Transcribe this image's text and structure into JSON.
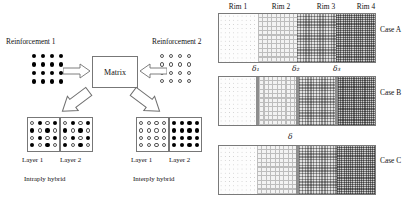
{
  "left_panel": {
    "reinforcement_1": {
      "label": "Reinforcement 1",
      "marker": "filled-dot",
      "rows": 4,
      "cols": 4
    },
    "reinforcement_2": {
      "label": "Reinforcement 2",
      "marker": "hollow-circle",
      "rows": 4,
      "cols": 4
    },
    "matrix": {
      "label": "Matrix"
    },
    "intraply": {
      "caption": "Intraply hybrid",
      "layer1_label": "Layer 1",
      "layer2_label": "Layer 2",
      "layer1_pattern": "checkerboard-mixed",
      "layer2_pattern": "checkerboard-mixed"
    },
    "interply": {
      "caption": "Interply hybrid",
      "layer1_label": "Layer 1",
      "layer2_label": "Layer 2",
      "layer1_pattern": "all-hollow",
      "layer2_pattern": "all-filled"
    },
    "arrows": {
      "reinf1_to_matrix": "block-arrow-right",
      "reinf2_to_matrix": "block-arrow-left",
      "matrix_to_intraply": "block-arrow-down-left",
      "matrix_to_interply": "block-arrow-down-right"
    }
  },
  "right_panel": {
    "rim_headers": [
      "Rim 1",
      "Rim 2",
      "Rim 3",
      "Rim 4"
    ],
    "rim_patterns": [
      "sparse-dots",
      "grid-crosshatch",
      "medium-checker",
      "dense-checker"
    ],
    "cases": [
      {
        "label": "Case A",
        "interface_labels": [],
        "interface_widths": [
          0,
          0,
          0
        ],
        "description": "no interphase layers"
      },
      {
        "label": "Case B",
        "interface_labels": [
          "δ₁",
          "δ₂",
          "δ₃"
        ],
        "interface_widths": [
          3,
          3,
          3
        ],
        "description": "three distinct interphase layers"
      },
      {
        "label": "Case C",
        "interface_labels": [
          "δ"
        ],
        "interface_widths": [
          0,
          3,
          0
        ],
        "description": "single interphase layer at center"
      }
    ]
  },
  "colors": {
    "outline": "#7a7a7a",
    "interface_bar": "#8e8e8e",
    "filled_marker": "#000000",
    "hollow_marker": "#555555",
    "background": "#ffffff"
  }
}
